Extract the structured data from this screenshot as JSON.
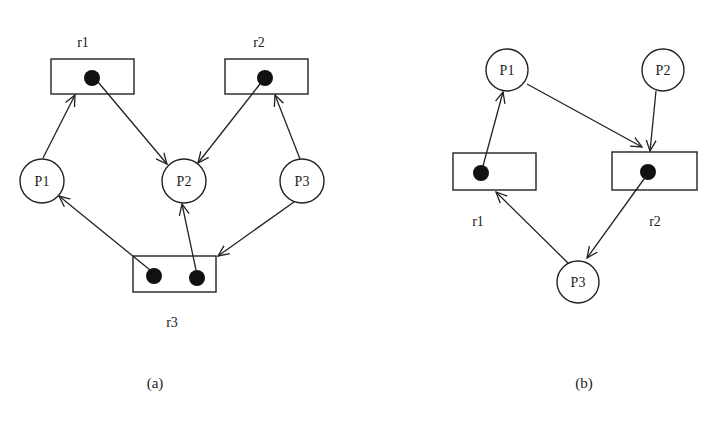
{
  "diagrams": [
    {
      "caption": "(a)",
      "processes": [
        {
          "id": "P1",
          "label": "P1"
        },
        {
          "id": "P2",
          "label": "P2"
        },
        {
          "id": "P3",
          "label": "P3"
        }
      ],
      "resources": [
        {
          "id": "r1",
          "label": "r1",
          "instances": 1
        },
        {
          "id": "r2",
          "label": "r2",
          "instances": 1
        },
        {
          "id": "r3",
          "label": "r3",
          "instances": 2
        }
      ],
      "edges": [
        {
          "from": "P1",
          "to": "r1",
          "type": "request"
        },
        {
          "from": "r1",
          "to": "P2",
          "type": "assignment"
        },
        {
          "from": "r2",
          "to": "P2",
          "type": "assignment"
        },
        {
          "from": "P3",
          "to": "r2",
          "type": "request"
        },
        {
          "from": "r3",
          "to": "P1",
          "type": "assignment"
        },
        {
          "from": "r3",
          "to": "P2",
          "type": "assignment"
        },
        {
          "from": "P3",
          "to": "r3",
          "type": "request"
        }
      ]
    },
    {
      "caption": "(b)",
      "processes": [
        {
          "id": "P1",
          "label": "P1"
        },
        {
          "id": "P2",
          "label": "P2"
        },
        {
          "id": "P3",
          "label": "P3"
        }
      ],
      "resources": [
        {
          "id": "r1",
          "label": "r1",
          "instances": 1
        },
        {
          "id": "r2",
          "label": "r2",
          "instances": 1
        }
      ],
      "edges": [
        {
          "from": "r1",
          "to": "P1",
          "type": "assignment"
        },
        {
          "from": "P1",
          "to": "r2",
          "type": "request"
        },
        {
          "from": "P2",
          "to": "r2",
          "type": "request"
        },
        {
          "from": "r2",
          "to": "P3",
          "type": "assignment"
        },
        {
          "from": "P3",
          "to": "r1",
          "type": "request"
        }
      ]
    }
  ]
}
